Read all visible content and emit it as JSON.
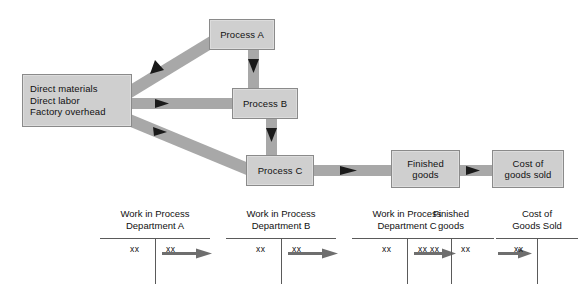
{
  "figure": {
    "type": "flowchart"
  },
  "flow": {
    "boxes": [
      {
        "id": "inputs",
        "label": "Direct materials\nDirect labor\nFactory overhead"
      },
      {
        "id": "proc_a",
        "label": "Process A"
      },
      {
        "id": "proc_b",
        "label": "Process B"
      },
      {
        "id": "proc_c",
        "label": "Process C"
      },
      {
        "id": "finished",
        "label": "Finished\ngoods"
      },
      {
        "id": "cogs",
        "label": "Cost of\ngoods sold"
      }
    ],
    "connectors": [
      {
        "from": "inputs",
        "to": "proc_a",
        "direction": "diagonal-up-right"
      },
      {
        "from": "inputs",
        "to": "proc_b",
        "direction": "right"
      },
      {
        "from": "inputs",
        "to": "proc_c",
        "direction": "diagonal-down-right"
      },
      {
        "from": "proc_a",
        "to": "proc_b",
        "direction": "down"
      },
      {
        "from": "proc_b",
        "to": "proc_c",
        "direction": "down"
      },
      {
        "from": "proc_c",
        "to": "finished",
        "direction": "right"
      },
      {
        "from": "finished",
        "to": "cogs",
        "direction": "right"
      }
    ]
  },
  "taccounts": [
    {
      "id": "a",
      "title": "Work in Process\nDepartment A",
      "debit": "xx",
      "credit": "xx",
      "transfer_arrow": true
    },
    {
      "id": "b",
      "title": "Work in Process\nDepartment B",
      "debit": "xx",
      "credit": "xx",
      "transfer_arrow": true
    },
    {
      "id": "c",
      "title": "Work in Process\nDepartment C",
      "debit": "xx",
      "credit": "xx",
      "transfer_arrow": true
    },
    {
      "id": "f",
      "title": "Finished\ngoods",
      "debit": "xx",
      "credit": "xx",
      "transfer_arrow": true
    },
    {
      "id": "g",
      "title": "Cost of\nGoods Sold",
      "debit": "xx",
      "credit": "",
      "transfer_arrow": false
    }
  ],
  "colors": {
    "box_fill": "#cfcfcf",
    "box_border": "#8a8a8a",
    "connector_band": "#a8a8a8",
    "arrowhead": "#1a1a1a",
    "taccount_rule": "#5a5a5a",
    "taccount_arrow": "#6e6e6e",
    "background": "#ffffff",
    "text": "#111111"
  }
}
